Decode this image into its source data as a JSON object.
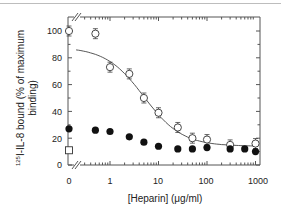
{
  "chart_data": {
    "type": "scatter",
    "title": "",
    "xlabel": "[Heparin]  (μg/ml)",
    "ylabel": "125I-IL-8 bound (% of maximum binding)",
    "ylabel_sup": "125",
    "ylabel_main": "I-IL-8 bound (% of maximum",
    "ylabel_line2": "binding)",
    "x_scale": "log (with broken axis at 0)",
    "x_ticks": [
      "0",
      "1",
      "10",
      "100",
      "1000"
    ],
    "y_ticks": [
      "0",
      "20",
      "40",
      "60",
      "80",
      "100"
    ],
    "ylim": [
      0,
      100
    ],
    "xlim": [
      0.3,
      1000
    ],
    "grid": false,
    "legend": "none",
    "series": [
      {
        "name": "open circles (with fitted curve)",
        "marker": "open-circle",
        "x": [
          0,
          0.5,
          1,
          2.5,
          5,
          10,
          25,
          50,
          100,
          300,
          1000
        ],
        "values": [
          100,
          98,
          73,
          68,
          50,
          39,
          28,
          20,
          19,
          15,
          16
        ]
      },
      {
        "name": "filled circles",
        "marker": "filled-circle",
        "x": [
          0,
          0.5,
          1,
          2.5,
          5,
          10,
          25,
          50,
          100,
          300,
          600,
          1000
        ],
        "values": [
          27,
          26,
          25,
          21,
          17,
          14,
          12,
          12,
          13,
          12,
          12,
          10
        ]
      },
      {
        "name": "open square",
        "marker": "open-square",
        "x": [
          0
        ],
        "values": [
          11
        ]
      }
    ]
  }
}
